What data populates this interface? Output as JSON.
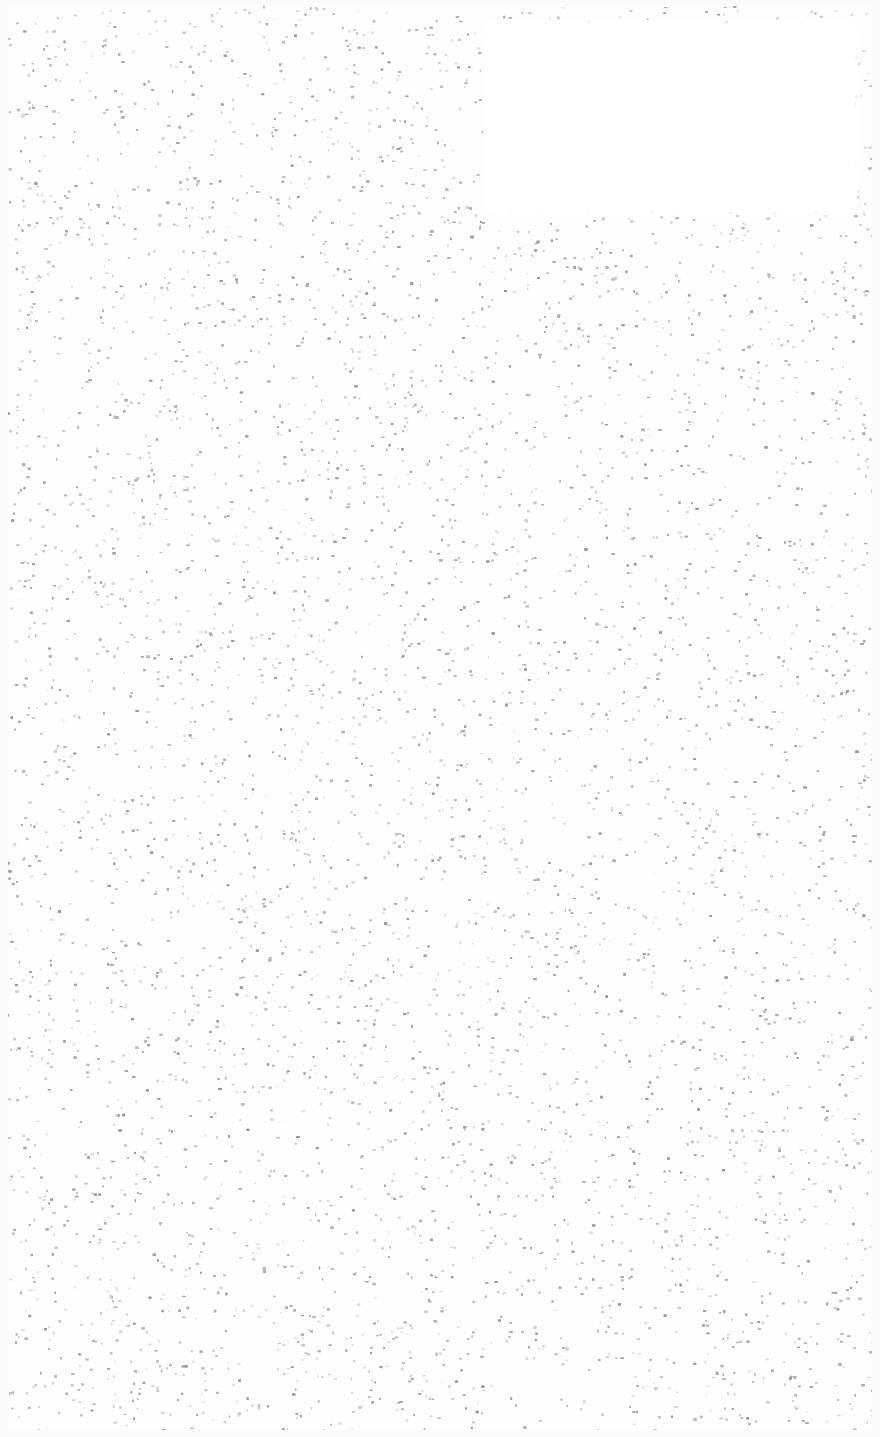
{
  "page": {
    "background_color": "#fdfdfd",
    "speckle_color": "#b4b4b4",
    "blank_panel_color": "#ffffff"
  }
}
